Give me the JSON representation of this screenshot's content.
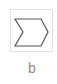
{
  "option": {
    "label": "b",
    "icon": "chevron-arrow-shape-icon",
    "stroke_color": "#555555",
    "border_color": "#e3e3e3",
    "label_color": "#8a8a8a"
  }
}
